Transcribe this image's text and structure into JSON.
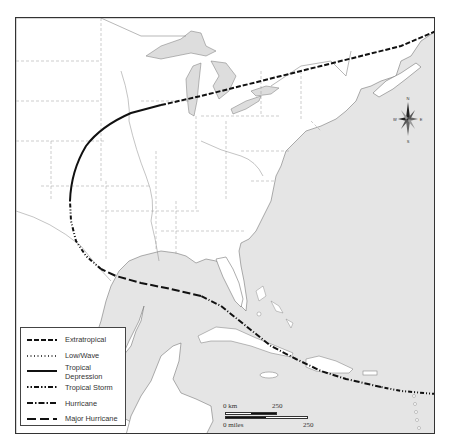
{
  "map": {
    "colors": {
      "water": "#e5e5e5",
      "land": "#ffffff",
      "border": "#888888",
      "track": "#111111",
      "frame": "#333333"
    },
    "track_segments": [
      {
        "type": "Tropical Storm",
        "region": "Atlantic east of Caribbean"
      },
      {
        "type": "Hurricane",
        "region": "Caribbean, north of Hispaniola and Cuba"
      },
      {
        "type": "Major Hurricane",
        "region": "Gulf of Mexico"
      },
      {
        "type": "Tropical Storm",
        "region": "Texas landfall and northward"
      },
      {
        "type": "Tropical Depression",
        "region": "Central US curving northeast"
      },
      {
        "type": "Extratropical",
        "region": "Great Lakes to Atlantic Canada"
      }
    ]
  },
  "legend": {
    "items": [
      {
        "label": "Extratropical",
        "style": "extratropical"
      },
      {
        "label": "Low/Wave",
        "style": "low-wave"
      },
      {
        "label": "Tropical Depression",
        "style": "tropical-depression"
      },
      {
        "label": "Tropical Storm",
        "style": "tropical-storm"
      },
      {
        "label": "Hurricane",
        "style": "hurricane"
      },
      {
        "label": "Major Hurricane",
        "style": "major-hurricane"
      }
    ]
  },
  "scale_bar": {
    "km_start": "0 km",
    "km_end": "250",
    "miles_start": "0 miles",
    "miles_end": "250"
  },
  "compass": {
    "north": "N",
    "south": "S",
    "east": "E",
    "west": "W"
  }
}
